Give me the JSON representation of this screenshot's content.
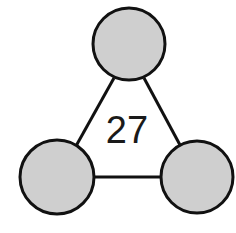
{
  "diagram": {
    "type": "number-triangle",
    "center_value": "27",
    "colors": {
      "node_fill": "#cfcfcf",
      "stroke": "#111111",
      "background": "#ffffff",
      "text": "#1a1a1a"
    },
    "nodes": [
      {
        "id": "top",
        "value": ""
      },
      {
        "id": "bottom-left",
        "value": ""
      },
      {
        "id": "bottom-right",
        "value": ""
      }
    ],
    "edges": [
      {
        "from": "top",
        "to": "bottom-left"
      },
      {
        "from": "top",
        "to": "bottom-right"
      },
      {
        "from": "bottom-left",
        "to": "bottom-right"
      }
    ]
  }
}
